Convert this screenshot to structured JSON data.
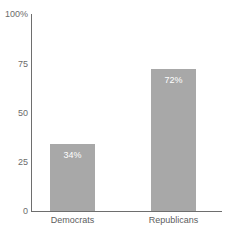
{
  "chart_data": {
    "type": "bar",
    "title": "",
    "subtitle": "",
    "xlabel": "",
    "ylabel": "",
    "categories": [
      "Democrats",
      "Republicans"
    ],
    "values": [
      34,
      72
    ],
    "value_labels": [
      "34%",
      "72%"
    ],
    "ylim": [
      0,
      100
    ],
    "yticks": [
      0,
      25,
      50,
      75,
      100
    ],
    "ytick_labels": [
      "0",
      "25",
      "50",
      "75",
      "100%"
    ],
    "grid": false,
    "legend": false,
    "legend_position": "none",
    "series": [
      {
        "name": "",
        "values": [
          34,
          72
        ]
      }
    ],
    "colors": {
      "bar_fill": "#a8a8a8",
      "axis": "#6e6e6e",
      "tick_text": "#6b6b6b",
      "category_text": "#5d5d5d",
      "value_text": "#ffffff",
      "background": "#ffffff"
    }
  },
  "axes": {
    "y_labels": [
      {
        "text": "100%",
        "value": 100
      },
      {
        "text": "75",
        "value": 75
      },
      {
        "text": "50",
        "value": 50
      },
      {
        "text": "25",
        "value": 25
      },
      {
        "text": "0",
        "value": 0
      }
    ]
  },
  "bars": [
    {
      "category": "Democrats",
      "value": 34,
      "label": "34%"
    },
    {
      "category": "Republicans",
      "value": 72,
      "label": "72%"
    }
  ]
}
